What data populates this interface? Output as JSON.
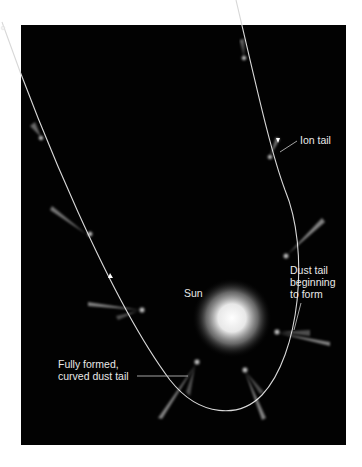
{
  "diagram": {
    "background_color": "#020202",
    "orbit_color": "#d8d8d8",
    "labels": {
      "ion_tail": "Ion tail",
      "dust_tail_forming": "Dust tail\nbeginning\nto form",
      "sun": "Sun",
      "dust_tail_formed": "Fully formed,\ncurved dust tail"
    }
  }
}
